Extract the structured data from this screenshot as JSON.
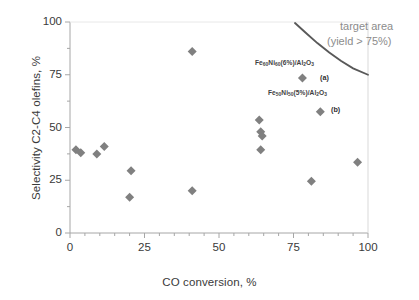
{
  "chart_data": {
    "type": "scatter",
    "title": "",
    "xlabel": "CO conversion, %",
    "ylabel": "Selectivity C2-C4 olefins, %",
    "xlim": [
      0,
      100
    ],
    "ylim": [
      0,
      100
    ],
    "xticks": [
      0,
      25,
      50,
      75,
      100
    ],
    "yticks": [
      0,
      25,
      50,
      75,
      100
    ],
    "x_minor_tick_step": 5,
    "grid": false,
    "legend": "none",
    "marker": {
      "shape": "diamond",
      "color": "#808080",
      "size": 9
    },
    "points": [
      {
        "x": 2.0,
        "y": 39.5,
        "label": ""
      },
      {
        "x": 3.6,
        "y": 38.0,
        "label": ""
      },
      {
        "x": 9.0,
        "y": 37.5,
        "label": ""
      },
      {
        "x": 11.5,
        "y": 41.0,
        "label": ""
      },
      {
        "x": 20.5,
        "y": 29.5,
        "label": ""
      },
      {
        "x": 20.0,
        "y": 17.0,
        "label": ""
      },
      {
        "x": 41.0,
        "y": 86.0,
        "label": ""
      },
      {
        "x": 41.0,
        "y": 20.0,
        "label": ""
      },
      {
        "x": 63.5,
        "y": 53.5,
        "label": ""
      },
      {
        "x": 64.0,
        "y": 48.0,
        "label": ""
      },
      {
        "x": 64.5,
        "y": 46.0,
        "label": ""
      },
      {
        "x": 64.0,
        "y": 39.5,
        "label": ""
      },
      {
        "x": 78.0,
        "y": 73.5,
        "label": "(a)"
      },
      {
        "x": 84.0,
        "y": 57.5,
        "label": "(b)"
      },
      {
        "x": 81.0,
        "y": 24.5,
        "label": ""
      },
      {
        "x": 96.5,
        "y": 33.5,
        "label": ""
      }
    ],
    "target_curve": {
      "name": "target area (yield > 75%)",
      "color": "#595959",
      "points": [
        {
          "x": 75.5,
          "y": 99.5
        },
        {
          "x": 79.0,
          "y": 95.0
        },
        {
          "x": 83.0,
          "y": 90.0
        },
        {
          "x": 87.0,
          "y": 85.5
        },
        {
          "x": 91.0,
          "y": 81.5
        },
        {
          "x": 95.0,
          "y": 78.0
        },
        {
          "x": 100.0,
          "y": 75.0
        }
      ]
    },
    "annotations": [
      {
        "name": "series-a-label",
        "text_plain": "Fe60Ni60(6%)/Al2O3",
        "parts": [
          {
            "t": "Fe",
            "sub": false
          },
          {
            "t": "60",
            "sub": true
          },
          {
            "t": "Ni",
            "sub": false
          },
          {
            "t": "60",
            "sub": true
          },
          {
            "t": "(6%)/Al",
            "sub": false
          },
          {
            "t": "2",
            "sub": true
          },
          {
            "t": "O",
            "sub": false
          },
          {
            "t": "3",
            "sub": true
          }
        ],
        "key": "(a)"
      },
      {
        "name": "series-b-label",
        "text_plain": "Fe50Ni50(5%)/Al2O3",
        "parts": [
          {
            "t": "Fe",
            "sub": false
          },
          {
            "t": "50",
            "sub": true
          },
          {
            "t": "Ni",
            "sub": false
          },
          {
            "t": "50",
            "sub": true
          },
          {
            "t": "(5%)/Al",
            "sub": false
          },
          {
            "t": "2",
            "sub": true
          },
          {
            "t": "O",
            "sub": false
          },
          {
            "t": "3",
            "sub": true
          }
        ],
        "key": "(b)"
      }
    ],
    "target_label_line1": "target area",
    "target_label_line2": "(yield > 75%)"
  },
  "axis": {
    "x_title": "CO conversion, %",
    "y_title": "Selectivity C2-C4 olefins, %",
    "x_tick_labels": [
      "0",
      "25",
      "50",
      "75",
      "100"
    ],
    "y_tick_labels": [
      "0",
      "25",
      "50",
      "75",
      "100"
    ]
  },
  "colors": {
    "marker": "#808080",
    "curve": "#595959",
    "axis": "#a6a6a6",
    "text": "#3a3a3a",
    "target_text": "#8c8c8c"
  }
}
